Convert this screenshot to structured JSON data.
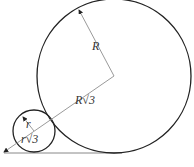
{
  "diagram": {
    "labels": {
      "big_radius": "R",
      "center_distance": "R√3",
      "small_radius": "r",
      "small_distance": "r√3"
    },
    "big_circle": {
      "cx": 114,
      "cy": 76,
      "r": 77
    },
    "small_circle": {
      "cx": 34,
      "cy": 131,
      "r": 21
    },
    "colors": {
      "stroke": "#222222",
      "guide": "#9a9a9a",
      "background": "#ffffff"
    }
  }
}
